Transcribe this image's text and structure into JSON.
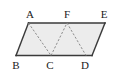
{
  "figure": {
    "kind": "geometry-diagram",
    "shape_name": "parallelogram",
    "canvas": {
      "width": 122,
      "height": 75
    },
    "colors": {
      "background": "#ffffff",
      "fill": "#ececec",
      "outline": "#3a3a3a",
      "dashed": "#8c8c8c",
      "label": "#1a1a1a"
    },
    "outline_points": "28.5,23 105,23 92,55.5 16,55.5",
    "vertices": [
      {
        "id": "A",
        "label": "A",
        "x": 28.5,
        "y": 23,
        "label_x": 30,
        "label_y": 9
      },
      {
        "id": "F",
        "label": "F",
        "x": 67,
        "y": 23,
        "label_x": 67,
        "label_y": 9
      },
      {
        "id": "E",
        "label": "E",
        "x": 105,
        "y": 23,
        "label_x": 104,
        "label_y": 9
      },
      {
        "id": "B",
        "label": "B",
        "x": 16,
        "y": 55.5,
        "label_x": 16,
        "label_y": 60
      },
      {
        "id": "C",
        "label": "C",
        "x": 51,
        "y": 55.5,
        "label_x": 50,
        "label_y": 60
      },
      {
        "id": "D",
        "label": "D",
        "x": 86,
        "y": 55.5,
        "label_x": 85,
        "label_y": 60
      }
    ],
    "solid_edges": [
      {
        "name": "edge-A-F-E-top",
        "x1": 28.5,
        "y1": 23,
        "x2": 105,
        "y2": 23
      },
      {
        "name": "edge-E-D-right",
        "x1": 105,
        "y1": 23,
        "x2": 92,
        "y2": 55.5
      },
      {
        "name": "edge-D-C-B-bottom",
        "x1": 92,
        "y1": 55.5,
        "x2": 16,
        "y2": 55.5
      },
      {
        "name": "edge-B-A-left",
        "x1": 16,
        "y1": 55.5,
        "x2": 28.5,
        "y2": 23
      }
    ],
    "dashed_edges": [
      {
        "name": "segment-A-C",
        "x1": 28.5,
        "y1": 23,
        "x2": 51,
        "y2": 55.5
      },
      {
        "name": "segment-C-F",
        "x1": 51,
        "y1": 55.5,
        "x2": 67,
        "y2": 23
      },
      {
        "name": "segment-F-D",
        "x1": 67,
        "y1": 23,
        "x2": 86,
        "y2": 55.5
      }
    ]
  }
}
